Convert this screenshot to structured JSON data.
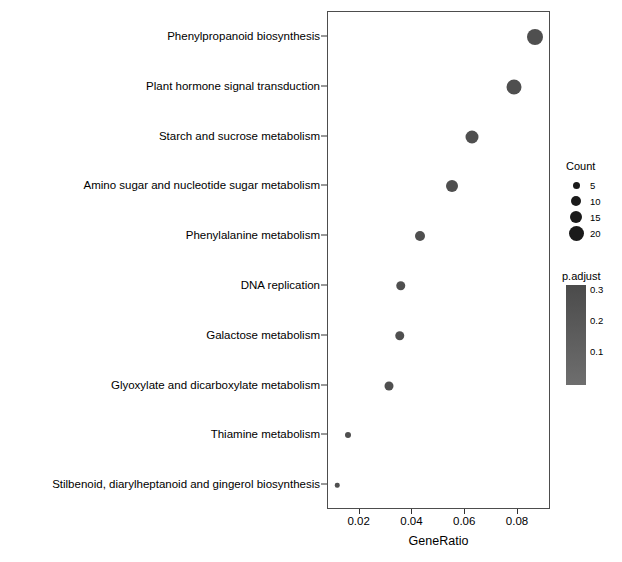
{
  "chart_data": {
    "type": "scatter",
    "title": "",
    "xlabel": "GeneRatio",
    "ylabel": "",
    "xlim": [
      0.008,
      0.0925
    ],
    "xticks": [
      0.02,
      0.04,
      0.06,
      0.08
    ],
    "xticklabels": [
      "0.02",
      "0.04",
      "0.06",
      "0.08"
    ],
    "grid": false,
    "categories": [
      "Phenylpropanoid biosynthesis",
      "Plant hormone signal transduction",
      "Starch and sucrose metabolism",
      "Amino sugar and nucleotide sugar metabolism",
      "Phenylalanine metabolism",
      "DNA replication",
      "Galactose metabolism",
      "Glyoxylate and dicarboxylate metabolism",
      "Thiamine metabolism",
      "Stilbenoid, diarylheptanoid and gingerol biosynthesis"
    ],
    "points": [
      {
        "label": "Phenylpropanoid biosynthesis",
        "gene_ratio": 0.0865,
        "count": 21,
        "p_adjust": 0.05,
        "color": "#4f4f4f",
        "diameter": 16
      },
      {
        "label": "Plant hormone signal transduction",
        "gene_ratio": 0.0785,
        "count": 19,
        "p_adjust": 0.1,
        "color": "#4f4f4f",
        "diameter": 15
      },
      {
        "label": "Starch and sucrose metabolism",
        "gene_ratio": 0.0625,
        "count": 15,
        "p_adjust": 0.12,
        "color": "#4f4f4f",
        "diameter": 13
      },
      {
        "label": "Amino sugar and nucleotide sugar metabolism",
        "gene_ratio": 0.055,
        "count": 13,
        "p_adjust": 0.15,
        "color": "#4f4f4f",
        "diameter": 12
      },
      {
        "label": "Phenylalanine metabolism",
        "gene_ratio": 0.043,
        "count": 10,
        "p_adjust": 0.18,
        "color": "#4f4f4f",
        "diameter": 10
      },
      {
        "label": "DNA replication",
        "gene_ratio": 0.0355,
        "count": 9,
        "p_adjust": 0.22,
        "color": "#4f4f4f",
        "diameter": 9.5
      },
      {
        "label": "Galactose metabolism",
        "gene_ratio": 0.0352,
        "count": 9,
        "p_adjust": 0.24,
        "color": "#4f4f4f",
        "diameter": 9.5
      },
      {
        "label": "Glyoxylate and dicarboxylate metabolism",
        "gene_ratio": 0.031,
        "count": 8,
        "p_adjust": 0.26,
        "color": "#4f4f4f",
        "diameter": 9
      },
      {
        "label": "Thiamine metabolism",
        "gene_ratio": 0.0155,
        "count": 4,
        "p_adjust": 0.29,
        "color": "#4f4f4f",
        "diameter": 6
      },
      {
        "label": "Stilbenoid, diarylheptanoid and gingerol biosynthesis",
        "gene_ratio": 0.0115,
        "count": 3,
        "p_adjust": 0.3,
        "color": "#4f4f4f",
        "diameter": 4.5
      }
    ],
    "legend_position": "right",
    "size_legend": {
      "title": "Count",
      "entries": [
        {
          "label": "5",
          "diameter": 7
        },
        {
          "label": "10",
          "diameter": 10
        },
        {
          "label": "15",
          "diameter": 12.5
        },
        {
          "label": "20",
          "diameter": 15
        }
      ]
    },
    "color_legend": {
      "title": "p.adjust",
      "ticks": [
        "0.3",
        "0.2",
        "0.1"
      ],
      "tick_values": [
        0.3,
        0.2,
        0.1
      ],
      "top_color": "#4b4b4b",
      "bottom_color": "#6e6e6e",
      "range": [
        0.05,
        0.3
      ]
    }
  }
}
